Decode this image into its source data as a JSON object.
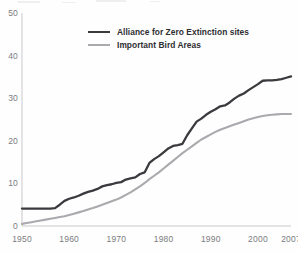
{
  "chart_data": {
    "type": "line",
    "title": "",
    "subtitle": "",
    "xlabel": "",
    "ylabel": "",
    "xlim": [
      1950,
      2007
    ],
    "ylim": [
      0,
      50
    ],
    "grid": false,
    "legend_position": "top-center",
    "x_ticks": [
      "1950",
      "1960",
      "1970",
      "1980",
      "1990",
      "2000",
      "2007"
    ],
    "x_tick_values": [
      1950,
      1960,
      1970,
      1980,
      1990,
      2000,
      2007
    ],
    "y_ticks": [
      "0",
      "10",
      "20",
      "30",
      "40",
      "50"
    ],
    "y_tick_values": [
      0,
      10,
      20,
      30,
      40,
      50
    ],
    "x": [
      1950,
      1951,
      1952,
      1953,
      1954,
      1955,
      1956,
      1957,
      1958,
      1959,
      1960,
      1961,
      1962,
      1963,
      1964,
      1965,
      1966,
      1967,
      1968,
      1969,
      1970,
      1971,
      1972,
      1973,
      1974,
      1975,
      1976,
      1977,
      1978,
      1979,
      1980,
      1981,
      1982,
      1983,
      1984,
      1985,
      1986,
      1987,
      1988,
      1989,
      1990,
      1991,
      1992,
      1993,
      1994,
      1995,
      1996,
      1997,
      1998,
      1999,
      2000,
      2001,
      2002,
      2003,
      2004,
      2005,
      2006,
      2007
    ],
    "series": [
      {
        "name": "Alliance for Zero Extinction sites",
        "color": "#3b3b3f",
        "values": [
          4.1,
          4.1,
          4.1,
          4.1,
          4.1,
          4.1,
          4.1,
          4.2,
          5.0,
          5.9,
          6.4,
          6.7,
          7.1,
          7.6,
          8.0,
          8.3,
          8.7,
          9.3,
          9.6,
          9.8,
          10.1,
          10.3,
          10.9,
          11.2,
          11.4,
          12.2,
          12.6,
          14.8,
          15.7,
          16.4,
          17.3,
          18.2,
          18.8,
          19.0,
          19.3,
          21.3,
          22.9,
          24.5,
          25.2,
          26.1,
          26.8,
          27.4,
          28.1,
          28.3,
          29.0,
          29.9,
          30.6,
          31.1,
          31.9,
          32.6,
          33.3,
          34.1,
          34.2,
          34.2,
          34.3,
          34.5,
          34.8,
          35.1
        ]
      },
      {
        "name": "Important Bird Areas",
        "color": "#aaaaae",
        "values": [
          0.5,
          0.7,
          0.9,
          1.1,
          1.3,
          1.5,
          1.7,
          1.9,
          2.1,
          2.3,
          2.6,
          2.9,
          3.2,
          3.5,
          3.9,
          4.2,
          4.6,
          5.0,
          5.4,
          5.8,
          6.2,
          6.7,
          7.3,
          7.9,
          8.6,
          9.3,
          10.1,
          11.0,
          11.8,
          12.6,
          13.5,
          14.4,
          15.3,
          16.2,
          17.1,
          17.9,
          18.7,
          19.5,
          20.3,
          20.9,
          21.5,
          22.1,
          22.6,
          23.0,
          23.4,
          23.8,
          24.2,
          24.6,
          25.0,
          25.3,
          25.6,
          25.8,
          26.0,
          26.1,
          26.2,
          26.3,
          26.3,
          26.3
        ]
      }
    ]
  },
  "legend": {
    "items": [
      {
        "label": "Alliance for Zero Extinction sites",
        "style": "dark"
      },
      {
        "label": "Important Bird Areas",
        "style": "light"
      }
    ]
  },
  "axes": {
    "axis_color": "#c9c9cd",
    "tick_label_color": "#7c7c80"
  }
}
